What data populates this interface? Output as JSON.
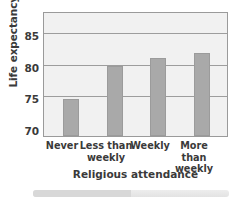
{
  "chart_data": {
    "type": "bar",
    "title": "",
    "xlabel": "Religious attendance",
    "ylabel": "Life expectancy, in years",
    "categories": [
      "Never",
      "Less than\nweekly",
      "Weekly",
      "More than\nweekly"
    ],
    "category_labels": [
      {
        "line1": "Never",
        "line2": ""
      },
      {
        "line1": "Less than",
        "line2": "weekly"
      },
      {
        "line1": "Weekly",
        "line2": ""
      },
      {
        "line1": "More than",
        "line2": "weekly"
      }
    ],
    "values": [
      75.2,
      79.7,
      80.9,
      81.5
    ],
    "ylim": [
      70,
      87
    ],
    "yticks": [
      70,
      75,
      80,
      85
    ],
    "ytick_labels": [
      "70",
      "75",
      "80",
      "85"
    ],
    "grid": true,
    "legend": "none",
    "bar_color": "#a9a9a9",
    "plot_background": "#f1f1f1",
    "gridline_color": "#9d9d9d",
    "text_color": "#3a3a3a",
    "axis_border_color": "#9a9a9a"
  }
}
